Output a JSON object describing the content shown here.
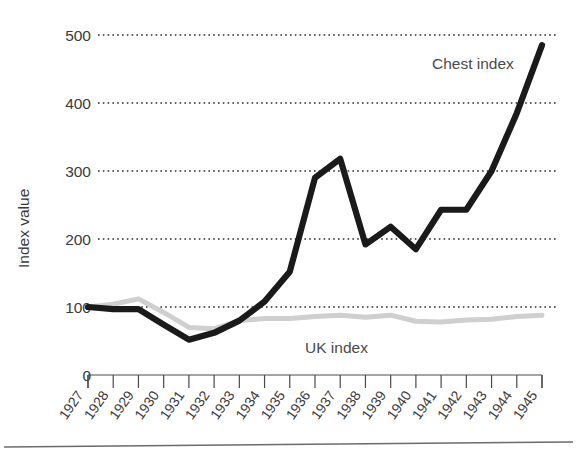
{
  "chart_data": {
    "type": "line",
    "title": "",
    "xlabel": "",
    "ylabel": "Index value",
    "ylim": [
      0,
      520
    ],
    "yticks": [
      0,
      100,
      200,
      300,
      400,
      500
    ],
    "ytick_labels": [
      "0",
      "100",
      "200",
      "300",
      "400",
      "500"
    ],
    "grid": "horizontal dotted gridlines at 100, 200, 300, 400, 500",
    "legend_position": "inline annotations next to each series",
    "categories": [
      "1927",
      "1928",
      "1929",
      "1930",
      "1931",
      "1932",
      "1933",
      "1934",
      "1935",
      "1936",
      "1937",
      "1938",
      "1939",
      "1940",
      "1941",
      "1942",
      "1943",
      "1944",
      "1945"
    ],
    "x": [
      1927,
      1928,
      1929,
      1930,
      1931,
      1932,
      1933,
      1934,
      1935,
      1936,
      1937,
      1938,
      1939,
      1940,
      1941,
      1942,
      1943,
      1944,
      1945
    ],
    "series": [
      {
        "name": "Chest index",
        "color": "#1a1a1a",
        "label_text": "Chest index",
        "values": [
          100,
          97,
          97,
          74,
          52,
          62,
          80,
          108,
          152,
          290,
          318,
          192,
          218,
          185,
          243,
          243,
          300,
          385,
          485
        ]
      },
      {
        "name": "UK index",
        "color": "#cfcfcf",
        "label_text": "UK index",
        "values": [
          100,
          104,
          112,
          92,
          70,
          68,
          80,
          83,
          83,
          86,
          88,
          85,
          88,
          79,
          78,
          81,
          82,
          86,
          88
        ]
      }
    ]
  },
  "annotations": {
    "chest_label": "Chest index",
    "uk_label": "UK index"
  },
  "axis": {
    "y_title": "Index value"
  },
  "colors": {
    "chest_line": "#1a1a1a",
    "uk_line": "#cfcfcf",
    "gridline": "#2e2e2e",
    "axis": "#4a4a4c",
    "text": "#3b3a3c",
    "background": "#ffffff"
  }
}
